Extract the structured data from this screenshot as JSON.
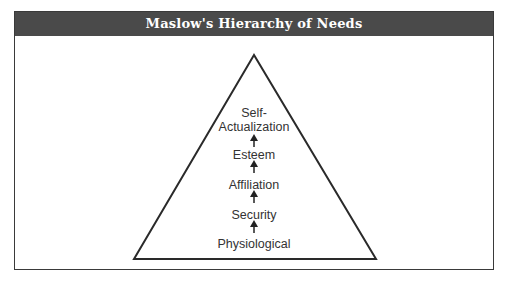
{
  "header": {
    "title": "Maslow's Hierarchy of Needs"
  },
  "pyramid": {
    "levels": [
      {
        "label_line1": "Self-",
        "label_line2": "Actualization"
      },
      {
        "label": "Esteem"
      },
      {
        "label": "Affiliation"
      },
      {
        "label": "Security"
      },
      {
        "label": "Physiological"
      }
    ],
    "arrow_direction": "up",
    "colors": {
      "header_bg": "#4a4a4a",
      "header_text": "#ffffff",
      "stroke": "#2a2a2a",
      "text": "#333333"
    }
  }
}
